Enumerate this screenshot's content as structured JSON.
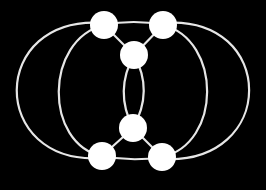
{
  "diagram": {
    "type": "graph",
    "background": "#000000",
    "edge_color": "#e6e6e6",
    "node_color": "#ffffff",
    "node_radius": 14,
    "nodes": [
      {
        "id": "A",
        "x": 104,
        "y": 25
      },
      {
        "id": "B",
        "x": 163,
        "y": 25
      },
      {
        "id": "C",
        "x": 134,
        "y": 55
      },
      {
        "id": "D",
        "x": 133,
        "y": 128
      },
      {
        "id": "E",
        "x": 102,
        "y": 156
      },
      {
        "id": "F",
        "x": 162,
        "y": 157
      }
    ],
    "edges": [
      {
        "id": "A-B",
        "from": "A",
        "to": "B",
        "path": "M104,25 Q134,19 163,25"
      },
      {
        "id": "E-F",
        "from": "E",
        "to": "F",
        "path": "M102,156 Q132,162 162,157"
      },
      {
        "id": "A-C",
        "from": "A",
        "to": "C",
        "path": "M104,25 L134,55"
      },
      {
        "id": "B-C",
        "from": "B",
        "to": "C",
        "path": "M163,25 L134,55"
      },
      {
        "id": "D-E",
        "from": "D",
        "to": "E",
        "path": "M133,128 L102,156"
      },
      {
        "id": "D-F",
        "from": "D",
        "to": "F",
        "path": "M133,128 L162,157"
      },
      {
        "id": "C-D-left",
        "from": "C",
        "to": "D",
        "path": "M134,55 Q114,91 133,128"
      },
      {
        "id": "C-D-right",
        "from": "C",
        "to": "D",
        "path": "M134,55 Q154,91 133,128"
      },
      {
        "id": "A-E-outer",
        "from": "A",
        "to": "E",
        "path": "M104,23 C-12,14 -12,166 102,158"
      },
      {
        "id": "A-E-inner",
        "from": "A",
        "to": "E",
        "path": "M104,25 C44,40 44,144 102,156"
      },
      {
        "id": "B-F-inner",
        "from": "B",
        "to": "F",
        "path": "M163,25 C222,40 222,144 162,157"
      },
      {
        "id": "B-F-outer",
        "from": "B",
        "to": "F",
        "path": "M163,23 C278,14 278,166 162,159"
      }
    ]
  }
}
